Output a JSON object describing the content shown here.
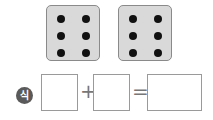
{
  "dice": [
    {
      "label": "die-1",
      "value": 6
    },
    {
      "label": "die-2",
      "value": 6
    }
  ],
  "equation": {
    "badge_label": "식",
    "plus": "+",
    "equals": "=",
    "boxes": [
      "",
      "",
      ""
    ]
  },
  "colors": {
    "die_face": "#d9d9d9",
    "pip": "#111111",
    "badge": "#5a5a5a"
  }
}
